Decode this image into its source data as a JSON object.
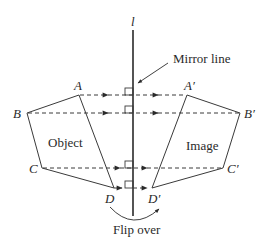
{
  "diagram": {
    "mirror_line_label": "l",
    "mirror_callout": "Mirror line",
    "object_label": "Object",
    "image_label": "Image",
    "action_label": "Flip over",
    "points": {
      "A": "A",
      "B": "B",
      "C": "C",
      "D": "D",
      "A_prime": "A′",
      "B_prime": "B′",
      "C_prime": "C′",
      "D_prime": "D′"
    },
    "colors": {
      "line": "#3a3a3a",
      "text": "#2a2a2a",
      "background": "#ffffff"
    }
  }
}
